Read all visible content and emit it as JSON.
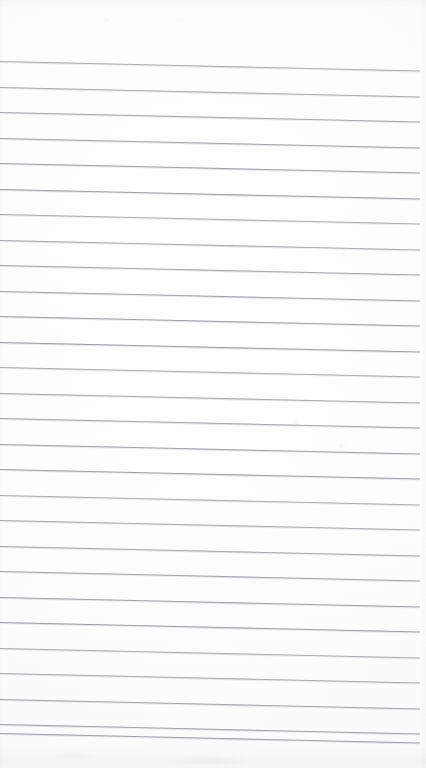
{
  "document": {
    "kind": "scanned-lined-paper",
    "title": "",
    "body_text": "",
    "visible_text": "",
    "page_width": 426,
    "page_height": 768,
    "background_color": "#fdfdfd",
    "rule_color": "#9b9ba2",
    "edge_shadow_color": "#000000"
  },
  "ruling": {
    "line_count": 28,
    "first_line_y": 61,
    "line_spacing": 25.5,
    "line_thickness": 1,
    "line_left_x": 0,
    "line_right_x": 420,
    "skew_degrees": 1.3,
    "top_margin_height": 60,
    "bottom_margin_height": 34,
    "lines_y": [
      61,
      86.5,
      112,
      137.5,
      163,
      188.5,
      214,
      239.5,
      265,
      290.5,
      316,
      341.5,
      367,
      392.5,
      418,
      443.5,
      469,
      494.5,
      520,
      545.5,
      571,
      596.5,
      622,
      647.5,
      673,
      698.5,
      724,
      733
    ]
  },
  "marks": [
    {
      "name": "speck-top-left",
      "x": 105,
      "y": 18,
      "w": 4,
      "h": 5,
      "opacity": 0.1
    },
    {
      "name": "speck-top-center",
      "x": 180,
      "y": 18,
      "w": 3,
      "h": 4,
      "opacity": 0.08
    },
    {
      "name": "smudge-upper-right",
      "x": 228,
      "y": 243,
      "w": 7,
      "h": 4,
      "opacity": 0.07
    },
    {
      "name": "smudge-right-mid",
      "x": 340,
      "y": 252,
      "w": 6,
      "h": 5,
      "opacity": 0.09
    },
    {
      "name": "smudge-right-upper",
      "x": 343,
      "y": 277,
      "w": 5,
      "h": 4,
      "opacity": 0.07
    },
    {
      "name": "smudge-center-lower",
      "x": 291,
      "y": 420,
      "w": 8,
      "h": 4,
      "opacity": 0.08
    },
    {
      "name": "smudge-right-lower",
      "x": 337,
      "y": 444,
      "w": 9,
      "h": 5,
      "opacity": 0.1
    },
    {
      "name": "smudge-bottom-band",
      "x": 150,
      "y": 757,
      "w": 120,
      "h": 7,
      "opacity": 0.05
    },
    {
      "name": "smudge-bottom-left",
      "x": 40,
      "y": 752,
      "w": 70,
      "h": 6,
      "opacity": 0.04
    }
  ]
}
